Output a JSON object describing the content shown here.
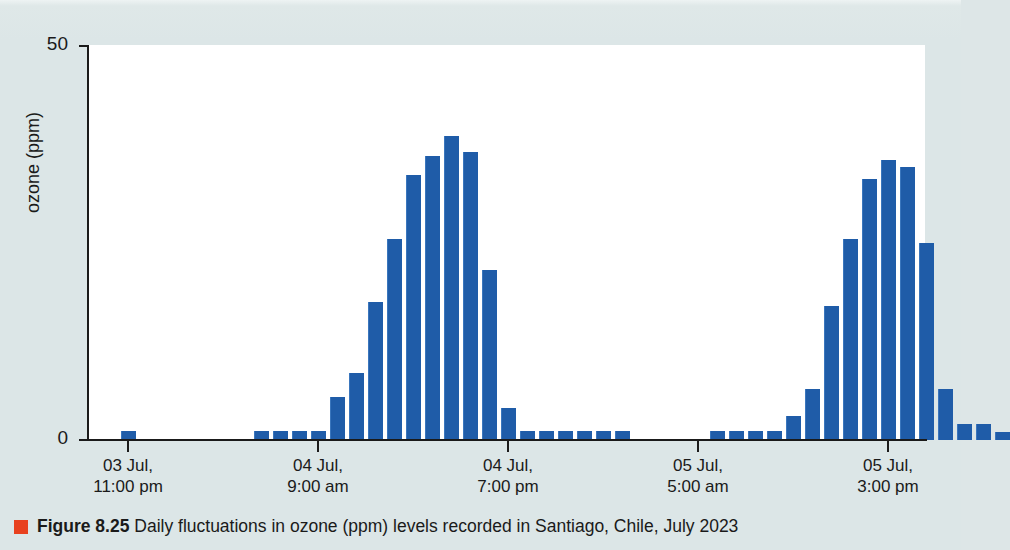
{
  "figure": {
    "label": "Figure 8.25",
    "caption": "Daily fluctuations in ozone (ppm) levels recorded in Santiago, Chile, July 2023",
    "marker_color": "#e8411f",
    "background_color": "#dce6e7",
    "plot_background_color": "#ffffff"
  },
  "chart_data": {
    "type": "bar",
    "title": "",
    "subtitle": "",
    "xlabel": "",
    "ylabel": "ozone (ppm)",
    "ylim": [
      0,
      50
    ],
    "y_ticks": [
      {
        "value": 0,
        "label": "0"
      },
      {
        "value": 50,
        "label": "50"
      }
    ],
    "grid": false,
    "legend": null,
    "bar_color": "#1f5ca8",
    "x_tick_labels": [
      {
        "index": 1,
        "line1": "03 Jul,",
        "line2": "11:00 pm"
      },
      {
        "index": 11,
        "line1": "04 Jul,",
        "line2": "9:00 am"
      },
      {
        "index": 21,
        "line1": "04 Jul,",
        "line2": "7:00 pm"
      },
      {
        "index": 31,
        "line1": "05 Jul,",
        "line2": "5:00 am"
      },
      {
        "index": 41,
        "line1": "05 Jul,",
        "line2": "3:00 pm"
      }
    ],
    "x_note": "hourly readings from 03 Jul 10:00 pm through 05 Jul 9:00 pm",
    "categories": [
      "03 Jul 10:00 pm",
      "03 Jul 11:00 pm",
      "04 Jul 12:00 am",
      "04 Jul 1:00 am",
      "04 Jul 2:00 am",
      "04 Jul 3:00 am",
      "04 Jul 4:00 am",
      "04 Jul 5:00 am",
      "04 Jul 6:00 am",
      "04 Jul 7:00 am",
      "04 Jul 8:00 am",
      "04 Jul 9:00 am",
      "04 Jul 10:00 am",
      "04 Jul 11:00 am",
      "04 Jul 12:00 pm",
      "04 Jul 1:00 pm",
      "04 Jul 2:00 pm",
      "04 Jul 3:00 pm",
      "04 Jul 4:00 pm",
      "04 Jul 5:00 pm",
      "04 Jul 6:00 pm",
      "04 Jul 7:00 pm",
      "04 Jul 8:00 pm",
      "04 Jul 9:00 pm",
      "04 Jul 10:00 pm",
      "04 Jul 11:00 pm",
      "05 Jul 12:00 am",
      "05 Jul 1:00 am",
      "05 Jul 2:00 am",
      "05 Jul 3:00 am",
      "05 Jul 4:00 am",
      "05 Jul 5:00 am",
      "05 Jul 6:00 am",
      "05 Jul 7:00 am",
      "05 Jul 8:00 am",
      "05 Jul 9:00 am",
      "05 Jul 10:00 am",
      "05 Jul 11:00 am",
      "05 Jul 12:00 pm",
      "05 Jul 1:00 pm",
      "05 Jul 2:00 pm",
      "05 Jul 3:00 pm",
      "05 Jul 4:00 pm",
      "05 Jul 5:00 pm",
      "05 Jul 6:00 pm",
      "05 Jul 7:00 pm",
      "05 Jul 8:00 pm",
      "05 Jul 9:00 pm"
    ],
    "values": [
      0,
      1.2,
      0,
      0,
      0,
      0,
      0,
      0,
      1.2,
      1.2,
      1.2,
      1.2,
      5.5,
      8.5,
      17.5,
      25.5,
      33.5,
      36.0,
      38.5,
      36.5,
      21.5,
      4.0,
      1.2,
      1.2,
      1.2,
      1.2,
      1.2,
      1.2,
      0,
      0,
      0,
      0,
      1.2,
      1.2,
      1.2,
      1.2,
      3.0,
      6.5,
      17.0,
      25.5,
      33.0,
      35.5,
      34.5,
      25.0,
      6.5,
      2.0,
      2.0,
      1.0
    ]
  },
  "layout": {
    "plot_left_px": 88,
    "plot_top_px": 45,
    "plot_width_px": 837,
    "plot_height_px": 395,
    "bar_pitch_px": 19,
    "bar_width_px": 14,
    "bar_start_px": 14
  }
}
